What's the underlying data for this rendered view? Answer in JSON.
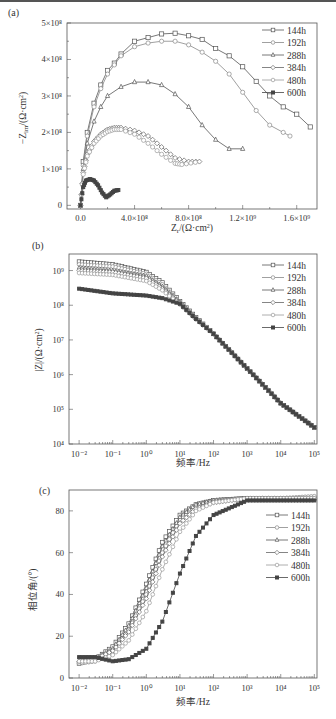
{
  "figure": {
    "panels": [
      "(a)",
      "(b)",
      "(c)"
    ]
  },
  "chart_data": [
    {
      "type": "scatter",
      "panel": "(a)",
      "title": "",
      "xlabel": "Z_r/(Ω·cm²)",
      "ylabel": "−Z_im/(Ω·cm²)",
      "xlim": [
        -100000000.0,
        1750000000.0
      ],
      "ylim": [
        -10000000.0,
        500000000.0
      ],
      "xticks": [
        "0.0",
        "4.0×10⁸",
        "8.0×10⁸",
        "1.2×10⁹",
        "1.6×10⁹"
      ],
      "xtick_values": [
        0,
        400000000.0,
        800000000.0,
        1200000000.0,
        1600000000.0
      ],
      "yticks": [
        "0",
        "1×10⁸",
        "2×10⁸",
        "3×10⁸",
        "4×10⁸",
        "5×10⁸"
      ],
      "ytick_values": [
        0,
        100000000.0,
        200000000.0,
        300000000.0,
        400000000.0,
        500000000.0
      ],
      "legend": [
        "144h",
        "192h",
        "288h",
        "384h",
        "480h",
        "600h"
      ],
      "legend_position": "upper right",
      "grid": false,
      "series": [
        {
          "name": "144h",
          "marker": "square",
          "x": [
            0.0,
            20000000.0,
            50000000.0,
            100000000.0,
            150000000.0,
            200000000.0,
            250000000.0,
            300000000.0,
            400000000.0,
            500000000.0,
            600000000.0,
            700000000.0,
            800000000.0,
            900000000.0,
            1000000000.0,
            1100000000.0,
            1200000000.0,
            1300000000.0,
            1400000000.0,
            1500000000.0,
            1600000000.0,
            1700000000.0
          ],
          "y": [
            0.0,
            120000000.0,
            200000000.0,
            280000000.0,
            330000000.0,
            370000000.0,
            390000000.0,
            415000000.0,
            450000000.0,
            460000000.0,
            470000000.0,
            472000000.0,
            465000000.0,
            455000000.0,
            430000000.0,
            410000000.0,
            380000000.0,
            340000000.0,
            300000000.0,
            270000000.0,
            250000000.0,
            215000000.0
          ]
        },
        {
          "name": "192h",
          "marker": "circle",
          "x": [
            0.0,
            20000000.0,
            50000000.0,
            100000000.0,
            150000000.0,
            200000000.0,
            250000000.0,
            300000000.0,
            400000000.0,
            500000000.0,
            600000000.0,
            700000000.0,
            800000000.0,
            900000000.0,
            1000000000.0,
            1100000000.0,
            1200000000.0,
            1300000000.0,
            1400000000.0,
            1500000000.0,
            1550000000.0
          ],
          "y": [
            0.0,
            110000000.0,
            190000000.0,
            270000000.0,
            320000000.0,
            360000000.0,
            385000000.0,
            410000000.0,
            435000000.0,
            445000000.0,
            450000000.0,
            450000000.0,
            440000000.0,
            420000000.0,
            395000000.0,
            360000000.0,
            310000000.0,
            260000000.0,
            220000000.0,
            200000000.0,
            190000000.0
          ]
        },
        {
          "name": "288h",
          "marker": "triangle",
          "x": [
            0.0,
            20000000.0,
            50000000.0,
            100000000.0,
            150000000.0,
            200000000.0,
            300000000.0,
            400000000.0,
            500000000.0,
            600000000.0,
            700000000.0,
            800000000.0,
            900000000.0,
            1000000000.0,
            1100000000.0,
            1200000000.0
          ],
          "y": [
            0.0,
            100000000.0,
            170000000.0,
            230000000.0,
            270000000.0,
            300000000.0,
            325000000.0,
            338000000.0,
            338000000.0,
            330000000.0,
            305000000.0,
            270000000.0,
            220000000.0,
            180000000.0,
            155000000.0,
            155000000.0
          ]
        },
        {
          "name": "384h",
          "marker": "diamond",
          "x": [
            0.0,
            20000000.0,
            50000000.0,
            100000000.0,
            150000000.0,
            200000000.0,
            250000000.0,
            300000000.0,
            400000000.0,
            500000000.0,
            600000000.0,
            700000000.0,
            800000000.0,
            880000000.0
          ],
          "y": [
            0.0,
            90000000.0,
            140000000.0,
            175000000.0,
            195000000.0,
            208000000.0,
            213000000.0,
            213000000.0,
            205000000.0,
            190000000.0,
            160000000.0,
            130000000.0,
            120000000.0,
            120000000.0
          ]
        },
        {
          "name": "480h",
          "marker": "circle",
          "x": [
            0.0,
            20000000.0,
            50000000.0,
            100000000.0,
            150000000.0,
            200000000.0,
            250000000.0,
            300000000.0,
            400000000.0,
            500000000.0,
            600000000.0,
            700000000.0,
            750000000.0,
            850000000.0
          ],
          "y": [
            0.0,
            85000000.0,
            135000000.0,
            170000000.0,
            190000000.0,
            202000000.0,
            208000000.0,
            208000000.0,
            195000000.0,
            170000000.0,
            140000000.0,
            115000000.0,
            112000000.0,
            118000000.0
          ]
        },
        {
          "name": "600h",
          "marker": "filled-square",
          "x": [
            0.0,
            20000000.0,
            40000000.0,
            70000000.0,
            100000000.0,
            130000000.0,
            160000000.0,
            190000000.0,
            220000000.0,
            250000000.0,
            280000000.0
          ],
          "y": [
            0.0,
            50000000.0,
            68000000.0,
            72000000.0,
            68000000.0,
            55000000.0,
            35000000.0,
            22000000.0,
            30000000.0,
            40000000.0,
            42000000.0
          ]
        }
      ]
    },
    {
      "type": "scatter",
      "panel": "(b)",
      "title": "",
      "xlabel": "频率/Hz",
      "ylabel": "|Z|/(Ω·cm²)",
      "xscale": "log",
      "yscale": "log",
      "xlim": [
        0.005,
        120000.0
      ],
      "ylim": [
        10000.0,
        3000000000.0
      ],
      "xticks": [
        "10⁻²",
        "10⁻¹",
        "10⁰",
        "10¹",
        "10²",
        "10³",
        "10⁴",
        "10⁵"
      ],
      "yticks": [
        "10⁴",
        "10⁵",
        "10⁶",
        "10⁷",
        "10⁸",
        "10⁹"
      ],
      "legend": [
        "144h",
        "192h",
        "288h",
        "384h",
        "480h",
        "600h"
      ],
      "legend_position": "upper right",
      "grid": false,
      "x": [
        0.01,
        0.1,
        1,
        3,
        10,
        30,
        100,
        1000,
        10000,
        100000
      ],
      "series": [
        {
          "name": "144h",
          "values": [
            1800000000.0,
            1500000000.0,
            900000000.0,
            450000000.0,
            130000000.0,
            45000000.0,
            15000000.0,
            1500000.0,
            150000.0,
            30000.0
          ]
        },
        {
          "name": "192h",
          "values": [
            1500000000.0,
            1300000000.0,
            800000000.0,
            400000000.0,
            120000000.0,
            43000000.0,
            15000000.0,
            1500000.0,
            150000.0,
            30000.0
          ]
        },
        {
          "name": "288h",
          "values": [
            1200000000.0,
            1000000000.0,
            700000000.0,
            350000000.0,
            120000000.0,
            42000000.0,
            15000000.0,
            1500000.0,
            150000.0,
            30000.0
          ]
        },
        {
          "name": "384h",
          "values": [
            1000000000.0,
            900000000.0,
            600000000.0,
            300000000.0,
            110000000.0,
            40000000.0,
            15000000.0,
            1500000.0,
            150000.0,
            30000.0
          ]
        },
        {
          "name": "480h",
          "values": [
            850000000.0,
            750000000.0,
            500000000.0,
            270000000.0,
            105000000.0,
            40000000.0,
            15000000.0,
            1500000.0,
            150000.0,
            30000.0
          ]
        },
        {
          "name": "600h",
          "values": [
            300000000.0,
            220000000.0,
            190000000.0,
            160000000.0,
            110000000.0,
            40000000.0,
            15000000.0,
            1500000.0,
            150000.0,
            30000.0
          ]
        }
      ]
    },
    {
      "type": "scatter",
      "panel": "(c)",
      "title": "",
      "xlabel": "频率/Hz",
      "ylabel": "相位角/(°)",
      "xscale": "log",
      "xlim": [
        0.005,
        120000.0
      ],
      "ylim": [
        0,
        90
      ],
      "xticks": [
        "10⁻²",
        "10⁻¹",
        "10⁰",
        "10¹",
        "10²",
        "10³",
        "10⁴",
        "10⁵"
      ],
      "yticks": [
        "0",
        "20",
        "40",
        "60",
        "80"
      ],
      "ytick_values": [
        0,
        20,
        40,
        60,
        80
      ],
      "legend": [
        "144h",
        "192h",
        "288h",
        "384h",
        "480h",
        "600h"
      ],
      "legend_position": "center right",
      "grid": false,
      "x": [
        0.01,
        0.03,
        0.1,
        0.3,
        1,
        3,
        10,
        30,
        100,
        1000,
        10000,
        100000
      ],
      "series": [
        {
          "name": "144h",
          "values": [
            7,
            9,
            15,
            26,
            45,
            65,
            78,
            83,
            85,
            86,
            86,
            86
          ]
        },
        {
          "name": "192h",
          "values": [
            7,
            8,
            13,
            23,
            40,
            60,
            76,
            82,
            85,
            86,
            86,
            87
          ]
        },
        {
          "name": "288h",
          "values": [
            8,
            9,
            14,
            25,
            43,
            63,
            77,
            83,
            85,
            86,
            86,
            86
          ]
        },
        {
          "name": "384h",
          "values": [
            8,
            9,
            13,
            22,
            38,
            58,
            74,
            81,
            84,
            86,
            86,
            86
          ]
        },
        {
          "name": "480h",
          "values": [
            8,
            8,
            11,
            18,
            32,
            52,
            70,
            80,
            84,
            86,
            86,
            86
          ]
        },
        {
          "name": "600h",
          "values": [
            10,
            10,
            8,
            9,
            14,
            27,
            50,
            68,
            78,
            85,
            85,
            85
          ]
        }
      ]
    }
  ]
}
